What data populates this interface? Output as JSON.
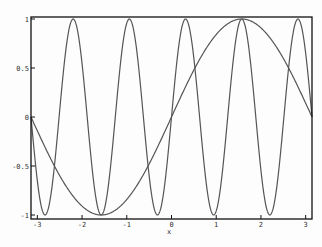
{
  "chart_data": {
    "type": "line",
    "title": "",
    "xlabel": "x",
    "ylabel": "",
    "xlim": [
      -3.14159,
      3.14159
    ],
    "ylim": [
      -1,
      1
    ],
    "grid": false,
    "legend": null,
    "x_ticks": [
      -3,
      -2,
      -1,
      0,
      1,
      2,
      3
    ],
    "x_tick_labels": [
      "-3",
      "-2",
      "-1",
      "0",
      "1",
      "2",
      "3"
    ],
    "y_ticks": [
      -1,
      -0.5,
      0,
      0.5,
      1
    ],
    "y_tick_labels": [
      "-1",
      "-0.5",
      "0",
      "0.5",
      "1"
    ],
    "series": [
      {
        "name": "sin(x)",
        "function": "sin(x)",
        "color": "#555555",
        "x": [
          -3.1416,
          -2.3562,
          -1.5708,
          -0.7854,
          0,
          0.7854,
          1.5708,
          2.3562,
          3.1416
        ],
        "values": [
          0,
          -0.707,
          -1,
          -0.707,
          0,
          0.707,
          1,
          0.707,
          0
        ]
      },
      {
        "name": "sin(5x)",
        "function": "sin(5x)",
        "color": "#555555",
        "x": [
          -3.1416,
          -2.8274,
          -2.5133,
          -2.1991,
          -1.885,
          -1.5708,
          -1.2566,
          -0.9425,
          -0.6283,
          -0.3142,
          0,
          0.3142,
          0.6283,
          0.9425,
          1.2566,
          1.5708,
          1.885,
          2.1991,
          2.5133,
          2.8274,
          3.1416
        ],
        "values": [
          0,
          -1,
          0,
          1,
          0,
          -1,
          0,
          1,
          0,
          -1,
          0,
          1,
          0,
          -1,
          0,
          1,
          0,
          -1,
          0,
          1,
          0
        ]
      }
    ]
  }
}
